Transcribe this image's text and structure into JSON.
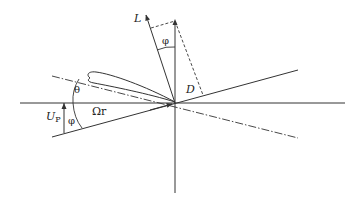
{
  "diagram": {
    "type": "blade-element-force-diagram",
    "labels": {
      "lift": "L",
      "drag": "D",
      "phi_top": "φ",
      "phi_bottom": "φ",
      "theta": "θ",
      "rotational_velocity": "Ωr",
      "inflow_velocity_main": "U",
      "inflow_velocity_sub": "P"
    },
    "colors": {
      "line": "#333333",
      "background": "#ffffff"
    }
  }
}
